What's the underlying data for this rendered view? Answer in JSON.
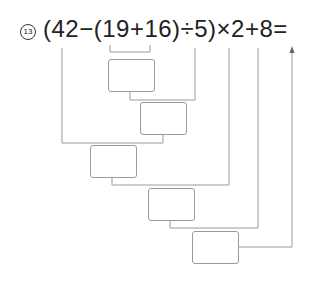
{
  "problem": {
    "number_label": "13",
    "expression": "(42−(19+16)÷5)×2+8="
  },
  "answer_boxes": [
    {
      "id": "box-1",
      "value": ""
    },
    {
      "id": "box-2",
      "value": ""
    },
    {
      "id": "box-3",
      "value": ""
    },
    {
      "id": "box-4",
      "value": ""
    },
    {
      "id": "box-5",
      "value": ""
    }
  ],
  "colors": {
    "line": "#9a9a9a",
    "text": "#222222"
  }
}
